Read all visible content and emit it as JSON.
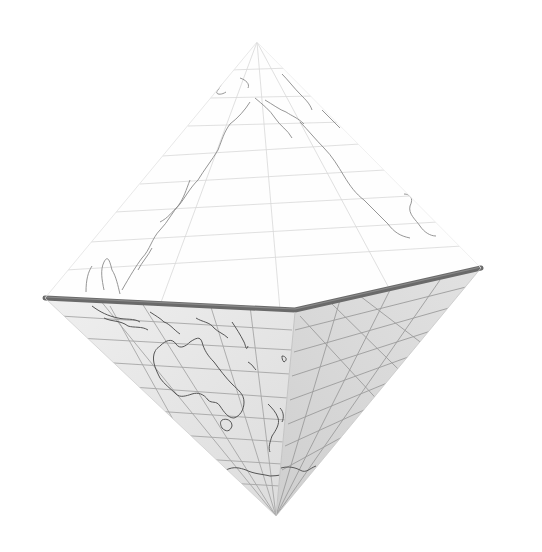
{
  "figure": {
    "subject": "Octahedral world map projection rendered as a 3D octahedron",
    "vertices": {
      "top": [
        257,
        42
      ],
      "left": [
        45,
        298
      ],
      "front": [
        295,
        310
      ],
      "right": [
        481,
        268
      ],
      "bottom": [
        276,
        516
      ]
    },
    "faces": [
      {
        "name": "upper-face",
        "region": "North Pacific / East Asia / Alaska / West coast of North America",
        "fill": "#fefefe"
      },
      {
        "name": "lower-left-face",
        "region": "Southeast Asia / Australia / New Zealand / Antarctica edge",
        "fill": "#e6e6e6"
      },
      {
        "name": "lower-right-face",
        "region": "South Pacific",
        "fill": "#d9d9d9"
      }
    ],
    "colors": {
      "background": "#ffffff",
      "equator_edge": "#6e6e6e",
      "graticule": "#a8a8a8",
      "coastline": "#555555",
      "upper_graticule": "#d4d4d4",
      "upper_coastline": "#8a8a8a"
    }
  }
}
